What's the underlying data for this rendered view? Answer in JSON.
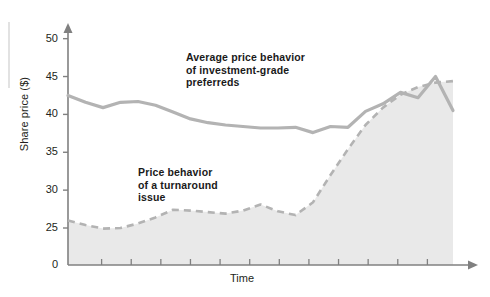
{
  "chart_data": {
    "type": "line",
    "title": "",
    "xlabel": "Time",
    "ylabel": "Share price ($)",
    "ylim": [
      0,
      52
    ],
    "y_ticks": [
      0,
      25,
      30,
      35,
      40,
      45,
      50
    ],
    "y_axis_note": "broken axis between 0 and 25",
    "x_ticks_count": 12,
    "x_tick_labels": [],
    "grid": false,
    "legend": "none (inline annotations)",
    "series": [
      {
        "name": "Average price behavior of investment-grade preferreds",
        "style": "solid",
        "color": "#b3b3b3",
        "x": [
          0,
          1,
          2,
          3,
          4,
          5,
          6,
          7,
          8,
          9,
          10,
          11,
          12,
          13,
          14,
          15,
          16,
          17,
          18,
          19,
          20,
          21,
          22
        ],
        "values": [
          42.5,
          41.6,
          40.9,
          41.6,
          41.7,
          41.2,
          40.3,
          39.4,
          38.9,
          38.6,
          38.4,
          38.2,
          38.2,
          38.3,
          37.6,
          38.4,
          38.3,
          40.4,
          41.4,
          42.9,
          42.2,
          45.0,
          40.5
        ]
      },
      {
        "name": "Price behavior of a turnaround issue",
        "style": "dashed",
        "color": "#b3b3b3",
        "fill": "#e9e9e9",
        "x": [
          0,
          1,
          2,
          3,
          4,
          5,
          6,
          7,
          8,
          9,
          10,
          11,
          12,
          13,
          14,
          15,
          16,
          17,
          18,
          19,
          20,
          21,
          22
        ],
        "values": [
          26.0,
          25.4,
          24.6,
          25.0,
          25.6,
          26.4,
          27.4,
          27.3,
          27.1,
          26.9,
          27.3,
          28.1,
          27.2,
          26.7,
          28.4,
          32.0,
          35.4,
          38.6,
          40.9,
          42.6,
          43.6,
          44.2,
          44.4
        ]
      }
    ],
    "annotations": [
      {
        "id": "annotation-investment-grade",
        "lines": [
          "Average price behavior",
          "of investment-grade",
          "preferreds"
        ]
      },
      {
        "id": "annotation-turnaround",
        "lines": [
          "Price behavior",
          "of a turnaround",
          "issue"
        ]
      }
    ],
    "colors": {
      "line": "#b3b3b3",
      "area_fill": "#e9e9e9",
      "axis": "#808080",
      "text": "#231f20",
      "background": "#ffffff"
    }
  }
}
